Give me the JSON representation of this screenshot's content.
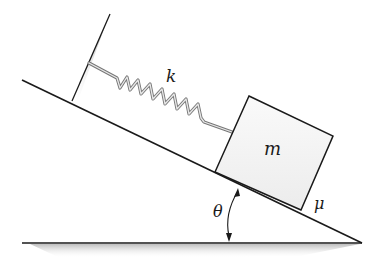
{
  "diagram": {
    "labels": {
      "spring_constant": "k",
      "mass": "m",
      "friction_coefficient": "μ",
      "angle": "θ"
    },
    "elements": [
      "wall",
      "spring",
      "block",
      "incline",
      "ground",
      "angle-arc"
    ],
    "colors": {
      "line": "#1a1a1a",
      "shadow": "#9a9a9a",
      "block_fill": "#f4f4f4",
      "spring": "#888888"
    }
  }
}
